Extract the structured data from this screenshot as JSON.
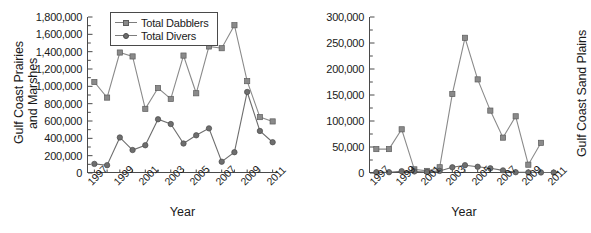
{
  "figure": {
    "type": "multi-panel-line-chart",
    "panel_count": 2
  },
  "legend": {
    "position": "top-left-of-left-panel",
    "entries": [
      {
        "label": "Total Dabblers",
        "marker": "square",
        "color": "#8a8a8a"
      },
      {
        "label": "Total Divers",
        "marker": "circle",
        "color": "#6e6e6e"
      }
    ]
  },
  "chart_data": [
    {
      "panel": "left",
      "type": "line",
      "title": "",
      "xlabel": "Year",
      "ylabel": "Gulf Coast Prairies\nand Marshes",
      "ylabel_lines": [
        "Gulf Coast Prairies",
        "and Marshes"
      ],
      "x": [
        1997,
        1998,
        1999,
        2000,
        2001,
        2002,
        2003,
        2004,
        2005,
        2006,
        2007,
        2008,
        2009,
        2010,
        2011
      ],
      "xtick_labels": [
        "1997",
        "1999",
        "2001",
        "2003",
        "2005",
        "2007",
        "2009",
        "2011"
      ],
      "xtick_values": [
        1997,
        1999,
        2001,
        2003,
        2005,
        2007,
        2009,
        2011
      ],
      "ytick_labels": [
        "0",
        "200,000",
        "400,000",
        "600,000",
        "800,000",
        "1,000,000",
        "1,200,000",
        "1,400,000",
        "1,600,000",
        "1,800,000"
      ],
      "ytick_values": [
        0,
        200000,
        400000,
        600000,
        800000,
        1000000,
        1200000,
        1400000,
        1600000,
        1800000
      ],
      "ylim": [
        0,
        1800000
      ],
      "xlim": [
        1996.5,
        2011.5
      ],
      "grid": false,
      "series": [
        {
          "name": "Total Dabblers",
          "marker": "square",
          "color": "#8a8a8a",
          "values": [
            1050000,
            870000,
            1390000,
            1345000,
            740000,
            980000,
            855000,
            1355000,
            920000,
            1460000,
            1440000,
            1705000,
            1060000,
            645000,
            595000
          ]
        },
        {
          "name": "Total Divers",
          "marker": "circle",
          "color": "#6e6e6e",
          "values": [
            105000,
            90000,
            410000,
            265000,
            320000,
            620000,
            565000,
            340000,
            435000,
            515000,
            130000,
            240000,
            935000,
            485000,
            355000
          ]
        }
      ]
    },
    {
      "panel": "right",
      "type": "line",
      "title": "",
      "xlabel": "Year",
      "ylabel": "Gulf Coast Sand Plains",
      "ylabel_lines": [
        "Gulf Coast Sand Plains"
      ],
      "x": [
        1997,
        1998,
        1999,
        2000,
        2001,
        2002,
        2003,
        2004,
        2005,
        2006,
        2007,
        2008,
        2009,
        2010,
        2011
      ],
      "xtick_labels": [
        "1997",
        "1999",
        "2001",
        "2003",
        "2005",
        "2007",
        "2009",
        "2011"
      ],
      "xtick_values": [
        1997,
        1999,
        2001,
        2003,
        2005,
        2007,
        2009,
        2011
      ],
      "ytick_labels": [
        "0",
        "50,000",
        "100,000",
        "150,000",
        "200,000",
        "250,000",
        "300,000"
      ],
      "ytick_values": [
        0,
        50000,
        100000,
        150000,
        200000,
        250000,
        300000
      ],
      "ylim": [
        0,
        300000
      ],
      "xlim": [
        1996.5,
        2011.5
      ],
      "grid": false,
      "series": [
        {
          "name": "Total Dabblers",
          "marker": "square",
          "color": "#8a8a8a",
          "values": [
            46000,
            46000,
            84000,
            7000,
            4000,
            11000,
            152000,
            260000,
            180000,
            120000,
            68000,
            109000,
            16000,
            58000,
            null
          ]
        },
        {
          "name": "Total Divers",
          "marker": "circle",
          "color": "#6e6e6e",
          "values": [
            1500,
            1500,
            3500,
            3000,
            2000,
            4000,
            11000,
            15000,
            12000,
            9000,
            5000,
            1500,
            1200,
            1000,
            900
          ]
        }
      ]
    }
  ]
}
